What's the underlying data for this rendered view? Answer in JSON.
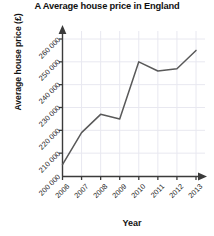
{
  "chart_data": {
    "type": "line",
    "title": "A  Average house price in England",
    "xlabel": "Year",
    "ylabel": "Average house price (£)",
    "categories": [
      "2006",
      "2007",
      "2008",
      "2009",
      "2010",
      "2011",
      "2012",
      "2013"
    ],
    "values": [
      205000,
      219000,
      227000,
      225000,
      250000,
      246000,
      247000,
      255000
    ],
    "series": [
      {
        "name": "Average house price",
        "values": [
          205000,
          219000,
          227000,
          225000,
          250000,
          246000,
          247000,
          255000
        ]
      }
    ],
    "x_tick_labels": [
      "2006",
      "2007",
      "2008",
      "2009",
      "2010",
      "2011",
      "2012",
      "2013"
    ],
    "y_tick_labels": [
      "200 000",
      "210 000",
      "220 000",
      "230 000",
      "240 000",
      "250 000",
      "260 000"
    ],
    "y_tick_values": [
      200000,
      210000,
      220000,
      230000,
      240000,
      250000,
      260000
    ],
    "ylim": [
      200000,
      262000
    ],
    "grid": true,
    "legend": false,
    "legend_position": "none",
    "line_color": "#595959",
    "grid_color": "#e8e8f0",
    "axis_color": "#3b3b3b",
    "markers": false
  }
}
